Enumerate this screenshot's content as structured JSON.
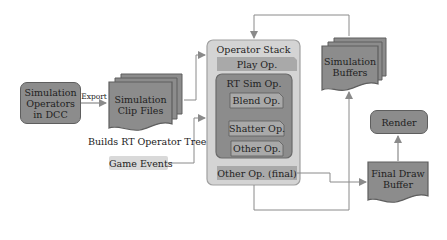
{
  "diagram": {
    "nodes": {
      "dcc": {
        "label_lines": [
          "Simulation",
          "Operators",
          "in DCC"
        ]
      },
      "clip_files": {
        "label_lines": [
          "Simulation",
          "Clip Files"
        ]
      },
      "operator_stack": {
        "title": "Operator Stack",
        "play_op": "Play Op.",
        "rt_sim_op": {
          "title": "RT Sim Op.",
          "children": [
            "Blend Op.",
            "Shatter Op.",
            "Other Op."
          ]
        },
        "final_op": "Other Op. (final)"
      },
      "sim_buffers": {
        "label_lines": [
          "Simulation",
          "Buffers"
        ]
      },
      "render": {
        "label": "Render"
      },
      "final_draw_buffer": {
        "label_lines": [
          "Final Draw",
          "Buffer"
        ]
      },
      "game_events": {
        "label": "Game Events"
      }
    },
    "edge_labels": {
      "export": "Export",
      "builds_tree": "Builds RT Operator Tree"
    },
    "colors": {
      "dark_fill": "#8c8c8c",
      "mid_fill": "#a9a9a9",
      "light_fill": "#d9d9d9",
      "stack_fill": "#d4d4d4",
      "line": "#8a8a8a"
    }
  }
}
